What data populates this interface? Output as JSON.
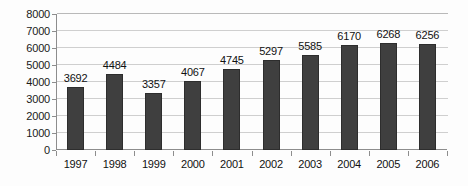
{
  "chart_data": {
    "type": "bar",
    "title": "",
    "xlabel": "",
    "ylabel": "",
    "categories": [
      "1997",
      "1998",
      "1999",
      "2000",
      "2001",
      "2002",
      "2003",
      "2004",
      "2005",
      "2006"
    ],
    "values": [
      3692,
      4484,
      3357,
      4067,
      4745,
      5297,
      5585,
      6170,
      6268,
      6256
    ],
    "data_labels": [
      "3692",
      "4484",
      "3357",
      "4067",
      "4745",
      "5297",
      "5585",
      "6170",
      "6268",
      "6256"
    ],
    "ylim": [
      0,
      8000
    ],
    "ytick_values": [
      8000,
      7000,
      6000,
      5000,
      4000,
      3000,
      2000,
      1000,
      0
    ],
    "ytick_labels": [
      "8000",
      "7000",
      "6000",
      "5000",
      "4000",
      "3000",
      "2000",
      "1000",
      "0"
    ],
    "grid": true,
    "grid_axis": "y",
    "legend": false,
    "legend_position": "none",
    "series": [
      {
        "name": "",
        "values": [
          3692,
          4484,
          3357,
          4067,
          4745,
          5297,
          5585,
          6170,
          6268,
          6256
        ]
      }
    ],
    "colors": {
      "bar": "#3f3f3f",
      "bar_border": "#2d2d2d",
      "gridline": "#cfcfcf",
      "axis": "#8d8d8d",
      "text": "#111111",
      "background": "#fdfdfd"
    }
  }
}
